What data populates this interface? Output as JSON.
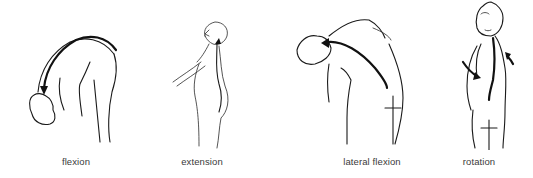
{
  "diagram": {
    "figures": [
      {
        "id": "flexion",
        "label": "flexion",
        "label_x": 76
      },
      {
        "id": "extension",
        "label": "extension",
        "label_x": 202
      },
      {
        "id": "lateral_flexion",
        "label": "lateral flexion",
        "label_x": 372
      },
      {
        "id": "rotation",
        "label": "rotation",
        "label_x": 479
      }
    ],
    "colors": {
      "line": "#1a1a1a",
      "label": "#3a3a3a",
      "background": "#ffffff"
    }
  }
}
